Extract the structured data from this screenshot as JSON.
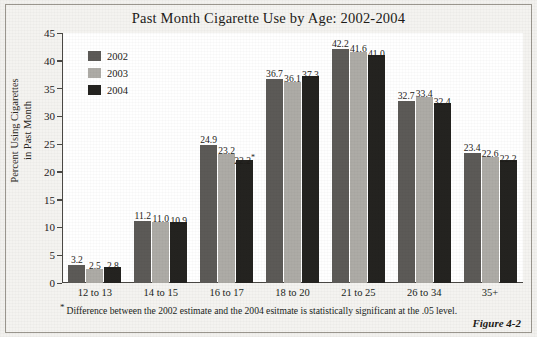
{
  "figure": {
    "title": "Past Month Cigarette Use by Age: 2002-2004",
    "number_label": "Figure 4-2",
    "footnote_marker": "*",
    "footnote": "Difference between the 2002 estimate and the 2004 esitmate is statistically significant at the .05 level."
  },
  "legend": {
    "entries": [
      {
        "label": "2002",
        "color": "#5c5a57"
      },
      {
        "label": "2003",
        "color": "#adaba6"
      },
      {
        "label": "2004",
        "color": "#242320"
      }
    ]
  },
  "axes": {
    "y_title_line1": "Percent Using Cigarettes",
    "y_title_line2": "in Past Month",
    "y_ticks": [
      "45",
      "40",
      "35",
      "30",
      "25",
      "20",
      "15",
      "10",
      "5",
      "0"
    ]
  },
  "chart_data": {
    "type": "bar",
    "title": "Past Month Cigarette Use by Age: 2002-2004",
    "xlabel": "",
    "ylabel": "Percent Using Cigarettes in Past Month",
    "ylim": [
      0,
      45
    ],
    "ytick_step": 5,
    "grid": false,
    "legend_position": "upper-left-inside",
    "categories": [
      "12 to 13",
      "14 to 15",
      "16 to 17",
      "18 to 20",
      "21 to 25",
      "26 to 34",
      "35+"
    ],
    "series": [
      {
        "name": "2002",
        "color": "#5c5a57",
        "values": [
          3.2,
          11.2,
          24.9,
          36.7,
          42.2,
          32.7,
          23.4
        ]
      },
      {
        "name": "2003",
        "color": "#adaba6",
        "values": [
          2.5,
          11.0,
          23.2,
          36.1,
          41.6,
          33.4,
          22.6
        ]
      },
      {
        "name": "2004",
        "color": "#242320",
        "values": [
          2.8,
          10.9,
          22.2,
          37.3,
          41.0,
          32.4,
          22.2
        ]
      }
    ],
    "value_labels": [
      [
        "3.2",
        "2.5",
        "2.8"
      ],
      [
        "11.2",
        "11.0",
        "10.9"
      ],
      [
        "24.9",
        "23.2",
        "22.2*"
      ],
      [
        "36.7",
        "36.1",
        "37.3"
      ],
      [
        "42.2",
        "41.6",
        "41.0"
      ],
      [
        "32.7",
        "33.4",
        "32.4"
      ],
      [
        "23.4",
        "22.6",
        "22.2"
      ]
    ],
    "annotations": [
      {
        "category": "16 to 17",
        "series": "2004",
        "marker": "*",
        "meaning": "statistically significant difference from 2002 at .05 level"
      }
    ]
  }
}
